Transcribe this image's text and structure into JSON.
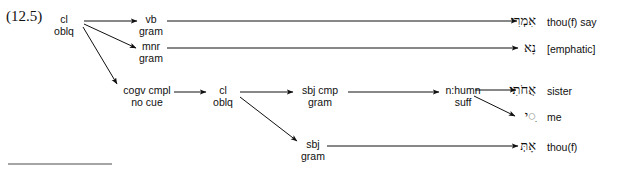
{
  "figure": {
    "example_number": "(12.5)",
    "footnote_rule": true
  },
  "nodes": [
    {
      "id": "root",
      "line1": "cl",
      "line2": "oblq"
    },
    {
      "id": "vb",
      "line1": "vb",
      "line2": "gram"
    },
    {
      "id": "mnr",
      "line1": "mnr",
      "line2": "gram"
    },
    {
      "id": "cogv",
      "line1": "cogv cmpl",
      "line2": "no cue"
    },
    {
      "id": "cl2",
      "line1": "cl",
      "line2": "oblq"
    },
    {
      "id": "sbjcmp",
      "line1": "sbj cmp",
      "line2": "gram"
    },
    {
      "id": "nhumn",
      "line1": "n:humn",
      "line2": "suff"
    },
    {
      "id": "sbj",
      "line1": "sbj",
      "line2": "gram"
    }
  ],
  "outputs": [
    {
      "id": "out-imri",
      "hebrew": "אִמְרִי",
      "gloss": "thou(f) say"
    },
    {
      "id": "out-na",
      "hebrew": "נָא",
      "gloss": "[emphatic]"
    },
    {
      "id": "out-ahoti",
      "hebrew": "אֲחֹתִי",
      "gloss": "sister"
    },
    {
      "id": "out-i",
      "hebrew": "ִ◌י",
      "gloss": "me"
    },
    {
      "id": "out-at",
      "hebrew": "אָתְּ",
      "gloss": "thou(f)"
    }
  ],
  "colors": {
    "ink": "#101010",
    "rule": "#333333",
    "background": "#ffffff"
  }
}
